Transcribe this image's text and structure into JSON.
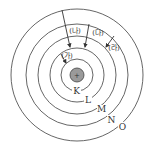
{
  "diagram": {
    "type": "bohr-atom-model",
    "nucleus": {
      "symbol": "+",
      "fill": "#999999",
      "stroke": "#444444"
    },
    "shells": [
      {
        "label": "K",
        "radius": 16
      },
      {
        "label": "L",
        "radius": 27
      },
      {
        "label": "M",
        "radius": 39
      },
      {
        "label": "N",
        "radius": 51
      },
      {
        "label": "O",
        "radius": 66
      }
    ],
    "transitions": [
      {
        "label": "(가)",
        "from": "L",
        "to": "K"
      },
      {
        "label": "(나)",
        "from": "O",
        "to": "L"
      },
      {
        "label": "(다)",
        "from": "N",
        "to": "L"
      },
      {
        "label": "(라)",
        "from": "N",
        "to": "M"
      }
    ],
    "colors": {
      "line": "#444444",
      "text": "#333333"
    }
  }
}
